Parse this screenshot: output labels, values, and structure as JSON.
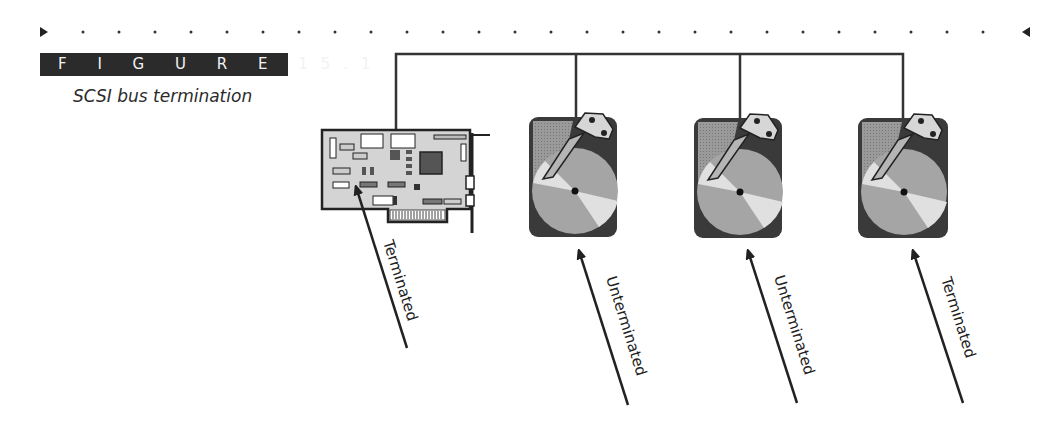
{
  "figure": {
    "label": "F I G U R E 15.1",
    "caption": "SCSI bus termination"
  },
  "colors": {
    "ink": "#222222",
    "figure_label_bg": "#2b2b2b",
    "drive_body": "#4a4a4a",
    "drive_fill": "#8f8f8f",
    "platter": "#a9a9a9",
    "platter_light": "#dcdcdc",
    "card_fill": "#d2d2d2"
  },
  "diagram": {
    "bus": "SCSI bus",
    "devices": [
      {
        "type": "host-adapter-card",
        "label": "Terminated"
      },
      {
        "type": "hard-drive",
        "label": "Unterminated"
      },
      {
        "type": "hard-drive",
        "label": "Unterminated"
      },
      {
        "type": "hard-drive",
        "label": "Terminated"
      }
    ]
  }
}
